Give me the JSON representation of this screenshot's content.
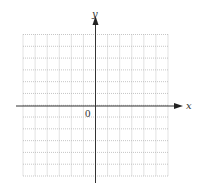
{
  "diagram": {
    "type": "cartesian-grid",
    "x_axis_label": "x",
    "y_axis_label": "y",
    "origin_label": "0",
    "grid": {
      "columns": 12,
      "rows": 12,
      "columns_left_of_y_axis": 6,
      "columns_right_of_y_axis": 6,
      "rows_above_x_axis": 6,
      "rows_below_x_axis": 6,
      "line_style": "dotted",
      "line_color": "#b8b8b8"
    },
    "axis_color": "#333333"
  }
}
